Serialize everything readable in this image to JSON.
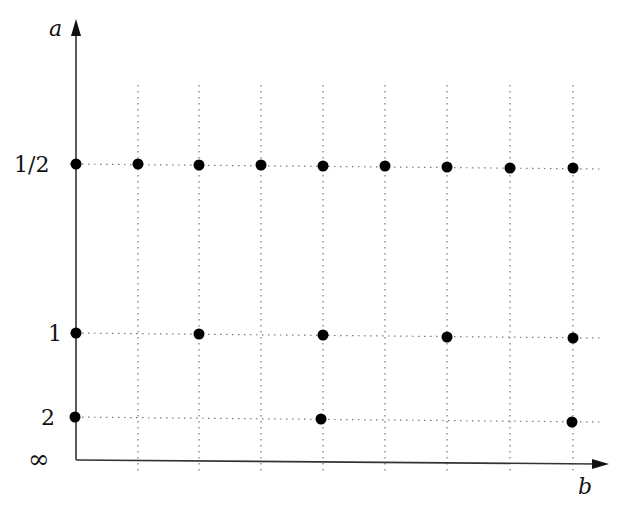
{
  "axes": {
    "y_label": "a",
    "x_label": "b",
    "y_ticks": [
      {
        "label": "1/2",
        "y": 164
      },
      {
        "label": "1",
        "y": 333
      },
      {
        "label": "2",
        "y": 417
      },
      {
        "label": "∞",
        "y": 460
      }
    ]
  },
  "grid": {
    "columns_x": [
      76,
      138,
      199,
      261,
      323,
      385,
      447,
      510,
      573
    ]
  },
  "points": [
    {
      "col": 0,
      "row": "1/2"
    },
    {
      "col": 1,
      "row": "1/2"
    },
    {
      "col": 2,
      "row": "1/2"
    },
    {
      "col": 3,
      "row": "1/2"
    },
    {
      "col": 4,
      "row": "1/2"
    },
    {
      "col": 5,
      "row": "1/2"
    },
    {
      "col": 6,
      "row": "1/2"
    },
    {
      "col": 7,
      "row": "1/2"
    },
    {
      "col": 8,
      "row": "1/2"
    },
    {
      "col": 0,
      "row": "1"
    },
    {
      "col": 2,
      "row": "1"
    },
    {
      "col": 4,
      "row": "1"
    },
    {
      "col": 6,
      "row": "1"
    },
    {
      "col": 8,
      "row": "1"
    },
    {
      "col": 0,
      "row": "2"
    },
    {
      "col": 4,
      "row": "2"
    },
    {
      "col": 8,
      "row": "2"
    }
  ]
}
